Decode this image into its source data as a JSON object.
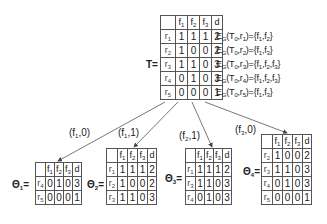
{
  "top_table": {
    "label": "T=",
    "headers": [
      "",
      "f1",
      "f2",
      "f3",
      "d"
    ],
    "rows": [
      {
        "id": "r1",
        "values": [
          "1",
          "1",
          "1",
          "2"
        ],
        "eg": "E_G(T_0,r_1)={f_1,f_2}"
      },
      {
        "id": "r2",
        "values": [
          "1",
          "0",
          "0",
          "2"
        ],
        "eg": "E_G(T_0,r_2)={f_1,f_3}"
      },
      {
        "id": "r3",
        "values": [
          "1",
          "1",
          "0",
          "3"
        ],
        "eg": "E_G(T_0,r_3)={f_1,f_2,f_3}"
      },
      {
        "id": "r4",
        "values": [
          "0",
          "1",
          "0",
          "3"
        ],
        "eg": "E_G(T_0,r_4)={f_1,f_2,f_3}"
      },
      {
        "id": "r5",
        "values": [
          "0",
          "0",
          "0",
          "1"
        ],
        "eg": "E_G(T_0,r_5)={f_1,f_3}"
      }
    ]
  },
  "edges": [
    {
      "label": "(f1,0)",
      "target": "theta1"
    },
    {
      "label": "(f1,1)",
      "target": "theta2"
    },
    {
      "label": "(f2,1)",
      "target": "theta3"
    },
    {
      "label": "(f3,0)",
      "target": "theta4"
    }
  ],
  "subtables": [
    {
      "name": "theta1",
      "label": "Θ1=",
      "rows": [
        {
          "id": "r4",
          "values": [
            "0",
            "1",
            "0",
            "3"
          ]
        },
        {
          "id": "r5",
          "values": [
            "0",
            "0",
            "0",
            "1"
          ]
        }
      ]
    },
    {
      "name": "theta2",
      "label": "Θ2=",
      "rows": [
        {
          "id": "r1",
          "values": [
            "1",
            "1",
            "1",
            "2"
          ]
        },
        {
          "id": "r2",
          "values": [
            "1",
            "0",
            "0",
            "2"
          ]
        },
        {
          "id": "r3",
          "values": [
            "1",
            "1",
            "0",
            "3"
          ]
        }
      ]
    },
    {
      "name": "theta3",
      "label": "Θ3=",
      "rows": [
        {
          "id": "r1",
          "values": [
            "1",
            "1",
            "1",
            "2"
          ]
        },
        {
          "id": "r3",
          "values": [
            "1",
            "1",
            "0",
            "3"
          ]
        },
        {
          "id": "r4",
          "values": [
            "0",
            "1",
            "0",
            "3"
          ]
        }
      ]
    },
    {
      "name": "theta4",
      "label": "Θ4=",
      "rows": [
        {
          "id": "r2",
          "values": [
            "1",
            "0",
            "0",
            "2"
          ]
        },
        {
          "id": "r3",
          "values": [
            "1",
            "1",
            "0",
            "3"
          ]
        },
        {
          "id": "r4",
          "values": [
            "0",
            "1",
            "0",
            "3"
          ]
        },
        {
          "id": "r5",
          "values": [
            "0",
            "0",
            "0",
            "1"
          ]
        }
      ]
    }
  ],
  "colors": {
    "line": "#555555",
    "text": "#222222"
  }
}
